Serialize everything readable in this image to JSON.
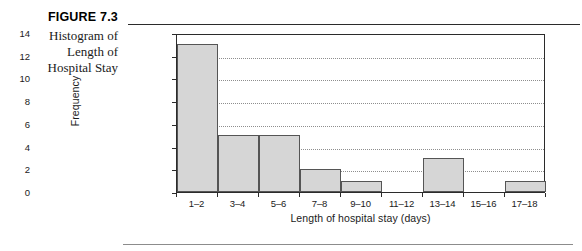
{
  "caption": {
    "figure_label": "FIGURE 7.3",
    "title_lines": [
      "Histogram of",
      "Length of",
      "Hospital Stay"
    ]
  },
  "chart_data": {
    "type": "bar",
    "title": "",
    "subtitle": "",
    "xlabel": "Length of hospital stay (days)",
    "ylabel": "Frequency",
    "categories": [
      "1–2",
      "3–4",
      "5–6",
      "7–8",
      "9–10",
      "11–12",
      "13–14",
      "15–16",
      "17–18"
    ],
    "values": [
      13,
      5,
      5,
      2,
      1,
      0,
      3,
      0,
      1
    ],
    "ylim": [
      0,
      14
    ],
    "yticks": [
      0,
      2,
      4,
      6,
      8,
      10,
      12,
      14
    ],
    "ytick_labels": [
      "0",
      "2",
      "4",
      "6",
      "8",
      "10",
      "12",
      "14"
    ],
    "grid": "horizontal-dotted",
    "legend": "none",
    "bar_fill_color": "#d6d6d6",
    "bar_edge_color": "#555555",
    "axis_color": "#2b2b2b",
    "gridline_color": "#8e8e8e",
    "background_color": "#ffffff"
  }
}
